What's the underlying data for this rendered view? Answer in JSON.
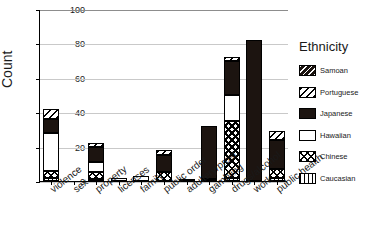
{
  "chart_data": {
    "type": "bar",
    "subtype": "stacked-bar",
    "title": "",
    "xlabel": "",
    "ylabel": "Count",
    "ylim": [
      0,
      100
    ],
    "yticks": [
      0,
      20,
      40,
      60,
      80,
      100
    ],
    "grid": true,
    "legend_position": "right",
    "legend_title": "Ethnicity",
    "categories": [
      "violence",
      "sex",
      "property",
      "licenses",
      "family",
      "public order",
      "adultery/prost.",
      "gambling",
      "drugs/alcohol",
      "work",
      "public health"
    ],
    "series": [
      {
        "name": "Caucasian",
        "pattern": "vertical-lines",
        "values": [
          2,
          0,
          1,
          0,
          0,
          0,
          0,
          0,
          2,
          0,
          2
        ]
      },
      {
        "name": "Chinese",
        "pattern": "checkerboard",
        "values": [
          4,
          0,
          4,
          0,
          0,
          5,
          1,
          1,
          33,
          0,
          5
        ]
      },
      {
        "name": "Hawaiian",
        "pattern": "solid-white",
        "values": [
          22,
          0,
          6,
          2,
          3,
          0,
          0,
          0,
          15,
          0,
          0
        ]
      },
      {
        "name": "Japanese",
        "pattern": "solid-black",
        "values": [
          8,
          0,
          9,
          0,
          0,
          10,
          0,
          31,
          20,
          82,
          17
        ]
      },
      {
        "name": "Portuguese",
        "pattern": "diagonal-light",
        "values": [
          6,
          0,
          2,
          0,
          0,
          3,
          0,
          0,
          2,
          0,
          5
        ]
      },
      {
        "name": "Samoan",
        "pattern": "diagonal-dark",
        "values": [
          0,
          0,
          0,
          0,
          0,
          0,
          0,
          0,
          0,
          0,
          0
        ]
      }
    ],
    "totals": [
      42,
      0,
      22,
      2,
      3,
      18,
      1,
      32,
      72,
      82,
      29
    ]
  },
  "legend": {
    "title": "Ethnicity",
    "items": [
      {
        "label": "Samoan",
        "swatch": "diagonal-dark-swatch"
      },
      {
        "label": "Portuguese",
        "swatch": "diagonal-light-swatch"
      },
      {
        "label": "Japanese",
        "swatch": "solid-black-swatch"
      },
      {
        "label": "Hawaiian",
        "swatch": "solid-white-swatch"
      },
      {
        "label": "Chinese",
        "swatch": "checkerboard-swatch"
      },
      {
        "label": "Caucasian",
        "swatch": "vertical-lines-swatch"
      }
    ]
  },
  "axis": {
    "y_title": "Count",
    "y_ticks": [
      "100",
      "80",
      "60",
      "40",
      "20",
      "0"
    ]
  }
}
